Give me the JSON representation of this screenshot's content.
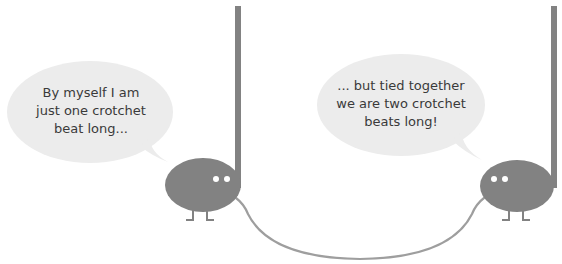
{
  "colors": {
    "background": "#ffffff",
    "bubble_fill": "#ececec",
    "note_fill": "#828282",
    "tie_stroke": "#9e9e9e",
    "eye_fill": "#ffffff",
    "text": "#3a3a3a"
  },
  "left_bubble": {
    "lines": [
      "By myself I am",
      "just one crotchet",
      "beat long..."
    ]
  },
  "right_bubble": {
    "lines": [
      "... but tied together",
      "we are two crotchet",
      "beats long!"
    ]
  },
  "left_note": {
    "label": "crotchet-note-character"
  },
  "right_note": {
    "label": "crotchet-note-character"
  },
  "tie": {
    "label": "tie"
  }
}
